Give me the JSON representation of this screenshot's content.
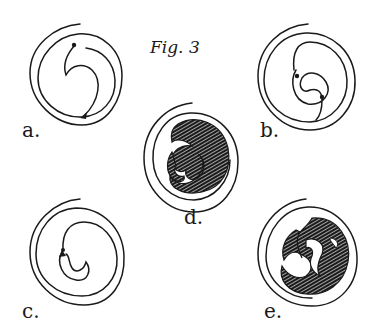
{
  "figure": {
    "title": "Fig. 3",
    "panels": [
      {
        "id": "a",
        "label": "a.",
        "description": "open spiral with single inner hook and two dot markers"
      },
      {
        "id": "b",
        "label": "b.",
        "description": "open spiral with double inner curl and dot markers"
      },
      {
        "id": "c",
        "label": "c.",
        "description": "open spiral with inner crescent and arrow marker"
      },
      {
        "id": "d",
        "label": "d.",
        "description": "open spiral with hatched two-lobed filled interior"
      },
      {
        "id": "e",
        "label": "e.",
        "description": "open spiral with hatched three-lobed triskele interior"
      }
    ]
  },
  "colors": {
    "ink": "#1a1a1a",
    "paper": "#ffffff"
  }
}
